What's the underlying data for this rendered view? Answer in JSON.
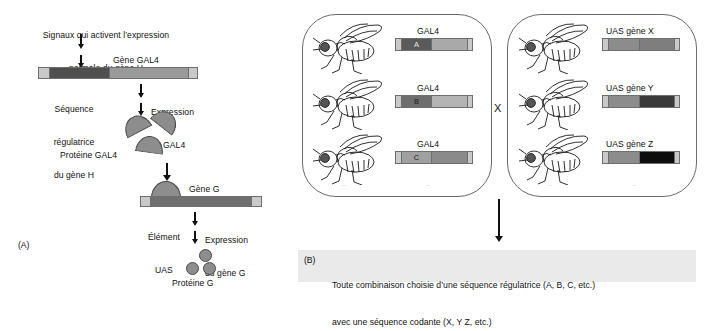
{
  "figure": {
    "panel_a": {
      "tag": "(A)",
      "signal_label_line1": "Signaux qui activent l’expression",
      "signal_label_line2": "normale du gène H",
      "gene_gal4_label": "Gène GAL4",
      "regulatory_label_line1": "Séquence",
      "regulatory_label_line2": "régulatrice",
      "regulatory_label_line3": "du gène H",
      "expression_gal4_line1": "Expression",
      "expression_gal4_line2": "de GAL4",
      "protein_gal4_label": "Protéine GAL4",
      "gene_g_label": "Gène G",
      "uas_element_line1": "Élément",
      "uas_element_line2": "UAS",
      "expression_geneg_line1": "Expression",
      "expression_geneg_line2": "du gène G",
      "protein_g_label": "Protéine G"
    },
    "panel_b": {
      "tag": "(B)",
      "cross_symbol": "X",
      "caption_line1": "Toute combinaison choisie d’une séquence régulatrice (A, B, C, etc.)",
      "caption_line2": "avec une séquence codante (X, Y Z, etc.)",
      "driver_box": {
        "rows": [
          {
            "construct_label": "GAL4",
            "regulator_letter": "A",
            "regulator_color": "#5a5a5a",
            "coding_color": "#a9a9a9"
          },
          {
            "construct_label": "GAL4",
            "regulator_letter": "B",
            "regulator_color": "#6e6e6e",
            "coding_color": "#b4b4b4"
          },
          {
            "construct_label": "GAL4",
            "regulator_letter": "C",
            "regulator_color": "#a0a0a0",
            "coding_color": "#8a8a8a"
          }
        ]
      },
      "responder_box": {
        "rows": [
          {
            "construct_label": "UAS gène X",
            "uas_color": "#8c8c8c",
            "coding_color": "#7e7e7e"
          },
          {
            "construct_label": "UAS gène Y",
            "uas_color": "#8c8c8c",
            "coding_color": "#3a3a3a"
          },
          {
            "construct_label": "UAS gène Z",
            "uas_color": "#8c8c8c",
            "coding_color": "#0d0d0d"
          }
        ]
      }
    },
    "colors": {
      "bar_tip": "#c9c9c9",
      "bar_regulatory": "#4f4f4f",
      "bar_coding": "#9a9a9a",
      "bar_gene_g": "#6f6f6f",
      "protein_fill": "#8d8d8d",
      "outline": "#6e6e6e",
      "caption_background": "#eaeaea"
    }
  }
}
